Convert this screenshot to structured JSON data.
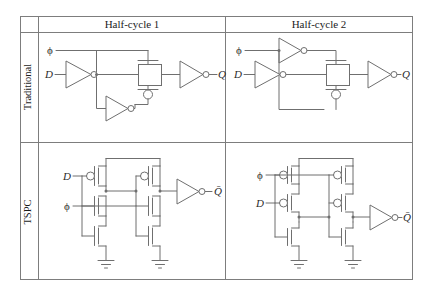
{
  "figure": {
    "type": "circuit-comparison-table",
    "columns": [
      {
        "id": "col-corner",
        "label": ""
      },
      {
        "id": "col-half-cycle-1",
        "label": "Half-cycle 1"
      },
      {
        "id": "col-half-cycle-2",
        "label": "Half-cycle 2"
      }
    ],
    "rows": [
      {
        "id": "row-traditional",
        "label": "Traditional"
      },
      {
        "id": "row-tspc",
        "label": "TSPC"
      }
    ],
    "colors": {
      "line": "#6f6f6f",
      "grid": "#7d7d7d",
      "text": "#1c1c1c",
      "background": "#ffffff"
    }
  },
  "cells": {
    "traditional_half1": {
      "name": "traditional-half-cycle-1-circuit",
      "inputs": [
        {
          "id": "clk",
          "label": "ϕ"
        },
        {
          "id": "data",
          "label": "D"
        }
      ],
      "outputs": [
        {
          "id": "q",
          "label": "Q"
        }
      ],
      "elements": [
        "input-inverter",
        "clock-inverter",
        "transmission-gate",
        "output-inverter"
      ],
      "clock_inverter_position": "bottom"
    },
    "traditional_half2": {
      "name": "traditional-half-cycle-2-circuit",
      "inputs": [
        {
          "id": "clk",
          "label": "ϕ"
        },
        {
          "id": "data",
          "label": "D"
        }
      ],
      "outputs": [
        {
          "id": "q",
          "label": "Q"
        }
      ],
      "elements": [
        "input-inverter",
        "clock-inverter",
        "transmission-gate",
        "output-inverter"
      ],
      "clock_inverter_position": "top"
    },
    "tspc_half1": {
      "name": "tspc-half-cycle-1-circuit",
      "inputs": [
        {
          "id": "data",
          "label": "D"
        },
        {
          "id": "clk",
          "label": "ϕ"
        }
      ],
      "outputs": [
        {
          "id": "qbar",
          "label": "Q̄"
        }
      ],
      "stacks": [
        {
          "id": "stack-1",
          "devices": [
            "pmos",
            "nmos",
            "nmos"
          ]
        },
        {
          "id": "stack-2",
          "devices": [
            "pmos",
            "nmos",
            "nmos"
          ]
        }
      ],
      "input_order": [
        "D",
        "ϕ"
      ],
      "elements": [
        "vdd-rail",
        "output-inverter",
        "ground-1",
        "ground-2"
      ]
    },
    "tspc_half2": {
      "name": "tspc-half-cycle-2-circuit",
      "inputs": [
        {
          "id": "clk",
          "label": "ϕ"
        },
        {
          "id": "data",
          "label": "D"
        }
      ],
      "outputs": [
        {
          "id": "qbar",
          "label": "Q̄"
        }
      ],
      "stacks": [
        {
          "id": "stack-1",
          "devices": [
            "pmos",
            "pmos",
            "nmos"
          ]
        },
        {
          "id": "stack-2",
          "devices": [
            "pmos",
            "pmos",
            "nmos"
          ]
        }
      ],
      "input_order": [
        "ϕ",
        "D"
      ],
      "elements": [
        "vdd-rail",
        "output-inverter",
        "ground-1",
        "ground-2"
      ]
    }
  }
}
